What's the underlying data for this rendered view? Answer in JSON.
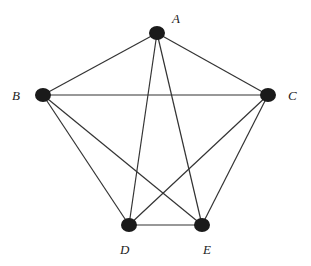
{
  "diagram": {
    "type": "graph",
    "nodes": [
      {
        "id": "A",
        "label": "A",
        "x": 157,
        "y": 33,
        "lx": 172,
        "ly": 11
      },
      {
        "id": "B",
        "label": "B",
        "x": 43,
        "y": 95,
        "lx": 12,
        "ly": 88
      },
      {
        "id": "C",
        "label": "C",
        "x": 268,
        "y": 95,
        "lx": 288,
        "ly": 88
      },
      {
        "id": "D",
        "label": "D",
        "x": 129,
        "y": 225,
        "lx": 120,
        "ly": 242
      },
      {
        "id": "E",
        "label": "E",
        "x": 202,
        "y": 225,
        "lx": 203,
        "ly": 242
      }
    ],
    "edges": [
      [
        "A",
        "B"
      ],
      [
        "A",
        "C"
      ],
      [
        "A",
        "D"
      ],
      [
        "A",
        "E"
      ],
      [
        "B",
        "C"
      ],
      [
        "B",
        "D"
      ],
      [
        "B",
        "E"
      ],
      [
        "C",
        "D"
      ],
      [
        "C",
        "E"
      ],
      [
        "D",
        "E"
      ]
    ],
    "node_color": "#1a1a1a",
    "edge_color": "#333333"
  }
}
